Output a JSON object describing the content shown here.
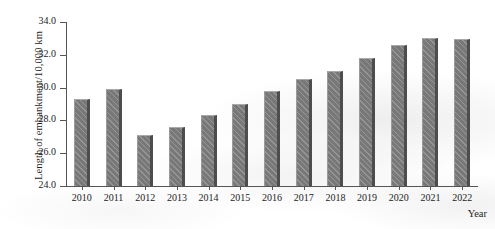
{
  "chart_data": {
    "type": "bar",
    "title": "",
    "xlabel": "Year",
    "ylabel": "Length of embankment/10,000 km",
    "categories": [
      "2010",
      "2011",
      "2012",
      "2013",
      "2014",
      "2015",
      "2016",
      "2017",
      "2018",
      "2019",
      "2020",
      "2021",
      "2022"
    ],
    "values": [
      29.3,
      29.9,
      27.1,
      27.6,
      28.3,
      29.0,
      29.8,
      30.5,
      31.0,
      31.8,
      32.6,
      33.0,
      32.95
    ],
    "ylim": [
      24.0,
      34.0
    ],
    "ytick_labels": [
      "24.0",
      "26.0",
      "28.0",
      "30.0",
      "32.0",
      "34.0"
    ],
    "ytick_values": [
      24.0,
      26.0,
      28.0,
      30.0,
      32.0,
      34.0
    ],
    "grid": false,
    "legend": null,
    "series": [
      {
        "name": "Length of embankment",
        "values": [
          29.3,
          29.9,
          27.1,
          27.6,
          28.3,
          29.0,
          29.8,
          30.5,
          31.0,
          31.8,
          32.6,
          33.0,
          32.95
        ]
      }
    ],
    "bar_color": "#787878",
    "bar_shadow_color": "#4d4d4d",
    "axis_color": "#555555",
    "text_color": "#1d1d1d"
  }
}
